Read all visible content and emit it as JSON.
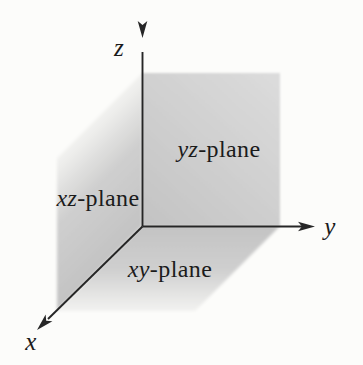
{
  "colors": {
    "background": "#fcfcfa",
    "axis": "#262626",
    "text": "#1b1b1b",
    "plane_dark": "#c3c3c3",
    "plane_mid": "#cfcfcf",
    "plane_light": "#dcdcdc",
    "plane_fade": "#f4f4f2"
  },
  "axes": {
    "x": {
      "label": "x"
    },
    "y": {
      "label": "y"
    },
    "z": {
      "label": "z"
    }
  },
  "planes": {
    "yz": {
      "italic": "yz",
      "suffix": "-plane"
    },
    "xz": {
      "italic": "xz",
      "suffix": "-plane"
    },
    "xy": {
      "italic": "xy",
      "suffix": "-plane"
    }
  }
}
